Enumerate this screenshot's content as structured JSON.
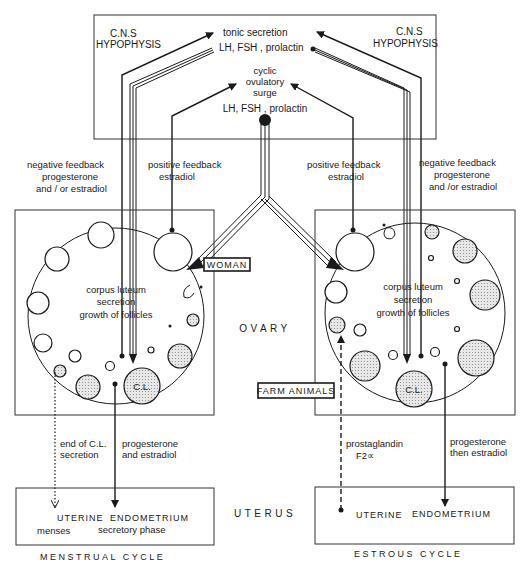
{
  "figure": {
    "cns_left": [
      "C.N.S",
      "HYPOPHYSIS"
    ],
    "cns_right": [
      "C.N.S",
      "HYPOPHYSIS"
    ],
    "tonic": [
      "tonic  secretion",
      "LH, FSH , prolactin"
    ],
    "surge": [
      "cyclic",
      "ovulatory",
      "surge",
      "LH, FSH , prolactin"
    ],
    "neg_feedback_left": [
      "negative  feedback",
      "progesterone",
      "and / or estradiol"
    ],
    "pos_feedback_left": [
      "positive feedback",
      "estradiol"
    ],
    "pos_feedback_right": [
      "positive feedback",
      "estradiol"
    ],
    "neg_feedback_right": [
      "negative  feedback",
      "progesterone",
      "and /or  estradiol"
    ],
    "ovary_center_left": [
      "corpus  luteum",
      "secretion",
      "growth  of  follicles"
    ],
    "ovary_center_right": [
      "corpus  luteum",
      "secretion",
      "growth  of  follicles"
    ],
    "woman_tag": "WOMAN",
    "farm_tag": "FARM ANIMALS",
    "ovary_label": "OVARY",
    "cl_label": "C.L.",
    "left_to_uterus_dotted": [
      "end of C.L.",
      "secretion"
    ],
    "left_to_uterus_solid": [
      "progesterone",
      "and estradiol"
    ],
    "right_to_uterus_dashed": [
      "prostaglandin",
      "F2∝"
    ],
    "right_to_uterus_solid": [
      "progesterone",
      "then estradiol"
    ],
    "uterus_label": "UTERUS",
    "uterus_left": {
      "line1_a": "UTERINE",
      "line1_b": "ENDOMETRIUM",
      "line2_a": "menses",
      "line2_b": "secretory phase"
    },
    "uterus_right": {
      "line1_a": "UTERINE",
      "line1_b": "ENDOMETRIUM"
    },
    "cycle_left": "MENSTRUAL   CYCLE",
    "cycle_right": "ESTROUS   CYCLE"
  }
}
